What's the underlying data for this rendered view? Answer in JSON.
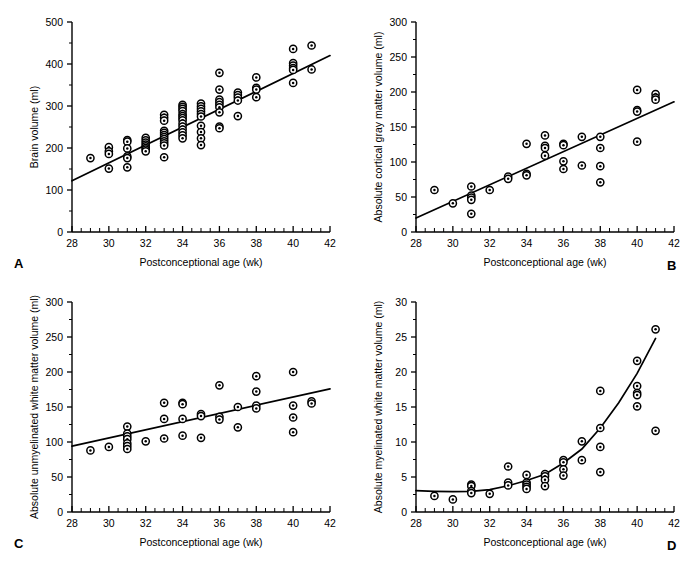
{
  "figure": {
    "background": "#ffffff",
    "ink": "#000000",
    "marker_style": "open-circle-with-center-dot",
    "panel_count": 4
  },
  "chart_data": [
    {
      "id": "A",
      "type": "scatter",
      "panel_letter": "A",
      "title": "",
      "xlabel": "Postconceptional age (wk)",
      "ylabel": "Brain volume (ml)",
      "xlim": [
        28,
        42
      ],
      "ylim": [
        0,
        500
      ],
      "xticks": [
        28,
        30,
        32,
        34,
        36,
        38,
        40,
        42
      ],
      "yticks": [
        0,
        100,
        200,
        300,
        400,
        500
      ],
      "x_minor_step": 1,
      "y_minor_step": 50,
      "grid": false,
      "legend": "none",
      "fit": {
        "type": "linear",
        "x0": 28,
        "y0": 122,
        "x1": 42,
        "y1": 420
      },
      "points": [
        [
          29,
          176
        ],
        [
          30,
          202
        ],
        [
          30,
          192
        ],
        [
          30,
          186
        ],
        [
          30,
          151
        ],
        [
          31,
          219
        ],
        [
          31,
          215
        ],
        [
          31,
          199
        ],
        [
          31,
          180
        ],
        [
          31,
          176
        ],
        [
          31,
          154
        ],
        [
          32,
          224
        ],
        [
          32,
          218
        ],
        [
          32,
          213
        ],
        [
          32,
          208
        ],
        [
          32,
          204
        ],
        [
          32,
          200
        ],
        [
          32,
          196
        ],
        [
          32,
          192
        ],
        [
          33,
          279
        ],
        [
          33,
          272
        ],
        [
          33,
          265
        ],
        [
          33,
          241
        ],
        [
          33,
          236
        ],
        [
          33,
          231
        ],
        [
          33,
          226
        ],
        [
          33,
          221
        ],
        [
          33,
          216
        ],
        [
          33,
          211
        ],
        [
          33,
          206
        ],
        [
          33,
          178
        ],
        [
          34,
          303
        ],
        [
          34,
          298
        ],
        [
          34,
          293
        ],
        [
          34,
          288
        ],
        [
          34,
          281
        ],
        [
          34,
          276
        ],
        [
          34,
          271
        ],
        [
          34,
          266
        ],
        [
          34,
          258
        ],
        [
          34,
          251
        ],
        [
          34,
          244
        ],
        [
          34,
          237
        ],
        [
          34,
          230
        ],
        [
          34,
          223
        ],
        [
          35,
          306
        ],
        [
          35,
          299
        ],
        [
          35,
          293
        ],
        [
          35,
          287
        ],
        [
          35,
          281
        ],
        [
          35,
          275
        ],
        [
          35,
          253
        ],
        [
          35,
          238
        ],
        [
          35,
          223
        ],
        [
          35,
          207
        ],
        [
          36,
          379
        ],
        [
          36,
          339
        ],
        [
          36,
          315
        ],
        [
          36,
          309
        ],
        [
          36,
          303
        ],
        [
          36,
          297
        ],
        [
          36,
          285
        ],
        [
          36,
          251
        ],
        [
          36,
          247
        ],
        [
          37,
          332
        ],
        [
          37,
          326
        ],
        [
          37,
          320
        ],
        [
          37,
          313
        ],
        [
          37,
          276
        ],
        [
          38,
          368
        ],
        [
          38,
          343
        ],
        [
          38,
          339
        ],
        [
          38,
          321
        ],
        [
          40,
          436
        ],
        [
          40,
          402
        ],
        [
          40,
          396
        ],
        [
          40,
          390
        ],
        [
          40,
          386
        ],
        [
          40,
          355
        ],
        [
          41,
          444
        ],
        [
          41,
          387
        ]
      ]
    },
    {
      "id": "B",
      "type": "scatter",
      "panel_letter": "B",
      "title": "",
      "xlabel": "Postconceptional age (wk)",
      "ylabel": "Absolute cortical gray matter volume (ml)",
      "xlim": [
        28,
        42
      ],
      "ylim": [
        0,
        300
      ],
      "xticks": [
        28,
        30,
        32,
        34,
        36,
        38,
        40,
        42
      ],
      "yticks": [
        0,
        50,
        100,
        150,
        200,
        250,
        300
      ],
      "x_minor_step": 1,
      "y_minor_step": 25,
      "grid": false,
      "legend": "none",
      "fit": {
        "type": "linear",
        "x0": 28,
        "y0": 20,
        "x1": 42,
        "y1": 186
      },
      "points": [
        [
          29,
          60
        ],
        [
          30,
          41
        ],
        [
          31,
          65
        ],
        [
          31,
          52
        ],
        [
          31,
          49
        ],
        [
          31,
          46
        ],
        [
          31,
          26
        ],
        [
          32,
          60
        ],
        [
          33,
          79
        ],
        [
          33,
          76
        ],
        [
          34,
          126
        ],
        [
          34,
          83
        ],
        [
          34,
          81
        ],
        [
          35,
          138
        ],
        [
          35,
          123
        ],
        [
          35,
          120
        ],
        [
          35,
          109
        ],
        [
          36,
          126
        ],
        [
          36,
          124
        ],
        [
          36,
          101
        ],
        [
          36,
          90
        ],
        [
          37,
          136
        ],
        [
          37,
          95
        ],
        [
          38,
          136
        ],
        [
          38,
          120
        ],
        [
          38,
          94
        ],
        [
          38,
          71
        ],
        [
          40,
          203
        ],
        [
          40,
          174
        ],
        [
          40,
          172
        ],
        [
          40,
          129
        ],
        [
          41,
          197
        ],
        [
          41,
          192
        ],
        [
          41,
          189
        ]
      ]
    },
    {
      "id": "C",
      "type": "scatter",
      "panel_letter": "C",
      "title": "",
      "xlabel": "Postconceptional age (wk)",
      "ylabel": "Absolute unmyelinated white matter volume (ml)",
      "xlim": [
        28,
        42
      ],
      "ylim": [
        0,
        300
      ],
      "xticks": [
        28,
        30,
        32,
        34,
        36,
        38,
        40,
        42
      ],
      "yticks": [
        0,
        50,
        100,
        150,
        200,
        250,
        300
      ],
      "x_minor_step": 1,
      "y_minor_step": 25,
      "grid": false,
      "legend": "none",
      "fit": {
        "type": "linear",
        "x0": 28,
        "y0": 94,
        "x1": 42,
        "y1": 176
      },
      "points": [
        [
          29,
          88
        ],
        [
          30,
          93
        ],
        [
          31,
          122
        ],
        [
          31,
          112
        ],
        [
          31,
          108
        ],
        [
          31,
          104
        ],
        [
          31,
          98
        ],
        [
          31,
          94
        ],
        [
          31,
          90
        ],
        [
          32,
          101
        ],
        [
          33,
          156
        ],
        [
          33,
          133
        ],
        [
          33,
          105
        ],
        [
          34,
          156
        ],
        [
          34,
          154
        ],
        [
          34,
          133
        ],
        [
          34,
          109
        ],
        [
          35,
          140
        ],
        [
          35,
          137
        ],
        [
          35,
          106
        ],
        [
          36,
          181
        ],
        [
          36,
          136
        ],
        [
          36,
          132
        ],
        [
          37,
          150
        ],
        [
          37,
          121
        ],
        [
          38,
          194
        ],
        [
          38,
          172
        ],
        [
          38,
          152
        ],
        [
          38,
          148
        ],
        [
          40,
          200
        ],
        [
          40,
          152
        ],
        [
          40,
          135
        ],
        [
          40,
          114
        ],
        [
          41,
          158
        ],
        [
          41,
          155
        ]
      ]
    },
    {
      "id": "D",
      "type": "scatter",
      "panel_letter": "D",
      "title": "",
      "xlabel": "Postconceptional age (wk)",
      "ylabel": "Absolute myelinated white matter volume (ml)",
      "xlim": [
        28,
        42
      ],
      "ylim": [
        0,
        30
      ],
      "xticks": [
        28,
        30,
        32,
        34,
        36,
        38,
        40,
        42
      ],
      "yticks": [
        0,
        5,
        10,
        15,
        20,
        25,
        30
      ],
      "x_minor_step": 1,
      "y_minor_step": 2.5,
      "grid": false,
      "legend": "none",
      "fit": {
        "type": "curve",
        "curve": [
          [
            28,
            3.05
          ],
          [
            29,
            2.95
          ],
          [
            30,
            2.9
          ],
          [
            31,
            2.95
          ],
          [
            32,
            3.2
          ],
          [
            33,
            3.75
          ],
          [
            34,
            4.5
          ],
          [
            35,
            5.4
          ],
          [
            36,
            7.0
          ],
          [
            37,
            9.0
          ],
          [
            38,
            12.0
          ],
          [
            39,
            15.6
          ],
          [
            40,
            19.8
          ],
          [
            41,
            24.8
          ]
        ]
      },
      "points": [
        [
          29,
          2.3
        ],
        [
          30,
          1.8
        ],
        [
          31,
          3.9
        ],
        [
          31,
          3.7
        ],
        [
          31,
          3.0
        ],
        [
          31,
          2.7
        ],
        [
          32,
          2.6
        ],
        [
          33,
          6.5
        ],
        [
          33,
          4.2
        ],
        [
          33,
          3.8
        ],
        [
          34,
          5.3
        ],
        [
          34,
          4.2
        ],
        [
          34,
          3.9
        ],
        [
          34,
          3.6
        ],
        [
          34,
          3.3
        ],
        [
          35,
          5.4
        ],
        [
          35,
          5.1
        ],
        [
          35,
          4.6
        ],
        [
          35,
          3.7
        ],
        [
          36,
          7.4
        ],
        [
          36,
          7.1
        ],
        [
          36,
          6.1
        ],
        [
          36,
          5.2
        ],
        [
          37,
          10.1
        ],
        [
          37,
          7.4
        ],
        [
          38,
          17.3
        ],
        [
          38,
          12.0
        ],
        [
          38,
          9.3
        ],
        [
          38,
          5.7
        ],
        [
          40,
          21.6
        ],
        [
          40,
          18.0
        ],
        [
          40,
          17.0
        ],
        [
          40,
          16.7
        ],
        [
          40,
          15.1
        ],
        [
          41,
          26.1
        ],
        [
          41,
          11.6
        ]
      ]
    }
  ]
}
